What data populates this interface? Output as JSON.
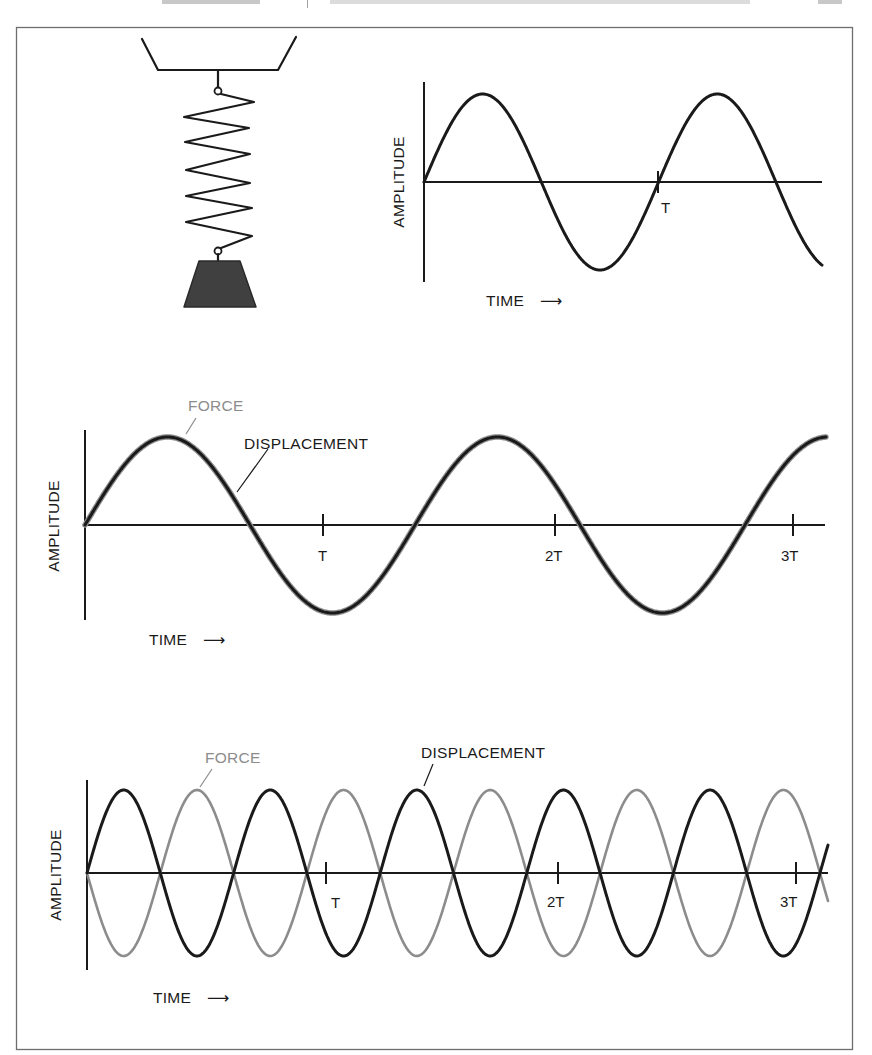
{
  "header": {
    "running_head_left": "",
    "running_head_right": "",
    "note": "header text cropped at top edge, not legible"
  },
  "colors": {
    "ink": "#1a1a1a",
    "force_gray": "#8c8c8c",
    "weight_fill": "#404040",
    "frame": "#6e6e6e"
  },
  "spring_diagram": {
    "description": "Mass hanging from a spring attached to a ceiling support"
  },
  "labels": {
    "amplitude": "AMPLITUDE",
    "time": "TIME",
    "force": "FORCE",
    "displacement": "DISPLACEMENT",
    "arrow": "⟶"
  },
  "chart_data": [
    {
      "id": "free-oscillation",
      "type": "line",
      "title": "",
      "xlabel": "TIME →",
      "ylabel": "AMPLITUDE",
      "grid": false,
      "legend": null,
      "x_tick_labels": [
        "T"
      ],
      "x_ticks_in_periods": [
        1
      ],
      "series": [
        {
          "name": "Displacement",
          "color": "#1a1a1a",
          "waveform": "sine",
          "amplitude": 1.0,
          "phase_deg": 0,
          "cycles_shown": 1.7,
          "period_T": 1.0
        }
      ],
      "layout": {
        "x0": 424,
        "x_end": 822,
        "y0": 182,
        "amp_px": 88,
        "period_px": 234.6,
        "axis_top": 82,
        "axis_bottom": 282,
        "axis_right": 822,
        "ticks_px": [
          658
        ]
      }
    },
    {
      "id": "resonance-in-phase",
      "type": "line",
      "title": "",
      "xlabel": "TIME →",
      "ylabel": "AMPLITUDE",
      "grid": false,
      "legend": null,
      "x_tick_labels": [
        "T",
        "2T",
        "3T"
      ],
      "x_ticks_in_periods": [
        1,
        2,
        3
      ],
      "annotations": [
        "FORCE",
        "DISPLACEMENT"
      ],
      "series": [
        {
          "name": "Force",
          "color": "#8c8c8c",
          "waveform": "sine",
          "amplitude": 1.0,
          "phase_deg": 0,
          "period_T": 1.4
        },
        {
          "name": "Displacement",
          "color": "#1a1a1a",
          "waveform": "sine",
          "amplitude": 1.0,
          "phase_deg": 0,
          "period_T": 1.4
        }
      ],
      "layout": {
        "x0": 85,
        "x_end": 826,
        "y0": 525,
        "amp_px": 88,
        "period_px": 330,
        "axis_top": 430,
        "axis_bottom": 620,
        "axis_right": 825,
        "ticks_px": [
          323,
          555,
          793
        ]
      }
    },
    {
      "id": "out-of-phase",
      "type": "line",
      "title": "",
      "xlabel": "TIME →",
      "ylabel": "AMPLITUDE",
      "grid": false,
      "legend": null,
      "x_tick_labels": [
        "T",
        "2T",
        "3T"
      ],
      "x_ticks_in_periods": [
        1,
        2,
        3
      ],
      "annotations": [
        "FORCE",
        "DISPLACEMENT"
      ],
      "series": [
        {
          "name": "Force",
          "color": "#8c8c8c",
          "waveform": "sine",
          "amplitude": 1.0,
          "phase_deg": 180,
          "period_T": 0.62
        },
        {
          "name": "Displacement",
          "color": "#1a1a1a",
          "waveform": "sine",
          "amplitude": 1.0,
          "phase_deg": 0,
          "period_T": 0.62
        }
      ],
      "layout": {
        "x0": 87,
        "x_end": 828,
        "y0": 873,
        "amp_px": 83,
        "period_px": 146.6,
        "axis_top": 780,
        "axis_bottom": 970,
        "axis_right": 828,
        "ticks_px": [
          326,
          558,
          796
        ]
      }
    }
  ]
}
